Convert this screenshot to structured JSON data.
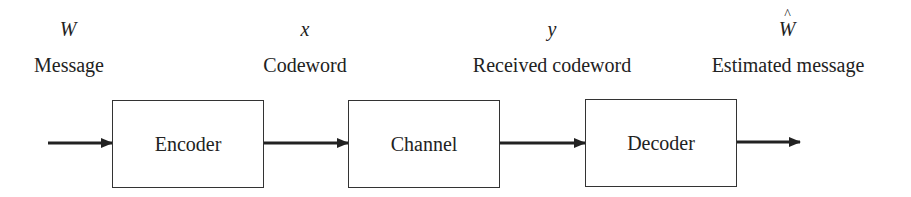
{
  "diagram": {
    "signals": [
      {
        "symbol": "W",
        "label": "Message",
        "hat": false
      },
      {
        "symbol": "x",
        "label": "Codeword",
        "hat": false
      },
      {
        "symbol": "y",
        "label": "Received codeword",
        "hat": false
      },
      {
        "symbol": "W",
        "label": "Estimated message",
        "hat": true
      }
    ],
    "blocks": [
      {
        "label": "Encoder"
      },
      {
        "label": "Channel"
      },
      {
        "label": "Decoder"
      }
    ],
    "edges": [
      {
        "from": "input",
        "to": "Encoder"
      },
      {
        "from": "Encoder",
        "to": "Channel"
      },
      {
        "from": "Channel",
        "to": "Decoder"
      },
      {
        "from": "Decoder",
        "to": "output"
      }
    ],
    "colors": {
      "line": "#222222",
      "background": "#ffffff"
    }
  }
}
